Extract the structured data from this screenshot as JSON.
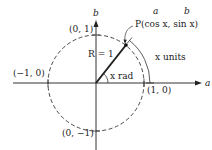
{
  "diagram": {
    "axes": {
      "horizontal_label": "a",
      "vertical_label": "b"
    },
    "points": {
      "top": "(0, 1)",
      "left": "(−1, 0)",
      "right": "(1, 0)",
      "bottom": "(0, −1)",
      "P": "P(cos x, sin x)"
    },
    "coord_annotations": {
      "a_over_cos": "a",
      "b_over_sin": "b"
    },
    "radius_label": "R = 1",
    "angle_label": "x rad",
    "arc_label": "x units",
    "colors": {
      "ink": "#222222",
      "background": "#ffffff"
    }
  }
}
